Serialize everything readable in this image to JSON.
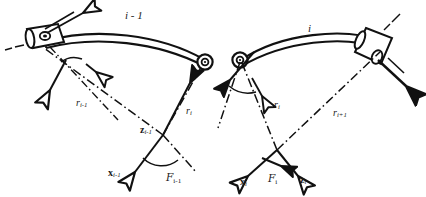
{
  "figure": {
    "type": "kinematic-chain-diagram",
    "ink_color": "#111111",
    "background_color": "#ffffff"
  },
  "labels": {
    "link_prev": "i - 1",
    "link_curr": "i",
    "r_prev": "r",
    "r_prev_sub": "i-1",
    "r_curr_left": "r",
    "r_curr_left_sub": "i",
    "r_curr_right": "r",
    "r_curr_right_sub": "i",
    "r_next": "r",
    "r_next_sub": "i+1",
    "z_prev": "z",
    "z_prev_sub": "i-1",
    "x_prev": "x",
    "x_prev_sub": "i-1",
    "frame_prev": "F",
    "frame_prev_sub": "i-1",
    "x_curr": "x",
    "x_curr_sub": "i",
    "frame_curr": "F",
    "frame_curr_sub": "i",
    "z_curr": "z",
    "z_curr_sub": "i"
  },
  "components": {
    "actuator_left": "prismatic-actuator-left",
    "actuator_right": "prismatic-actuator-right",
    "joint_left": "revolute-joint-left",
    "joint_right": "revolute-joint-right",
    "beam_left": "curved-link-beam-left",
    "beam_right": "curved-link-beam-right",
    "angle_arc_left": "joint-angle-arc-left",
    "angle_arc_right": "joint-angle-arc-right"
  }
}
